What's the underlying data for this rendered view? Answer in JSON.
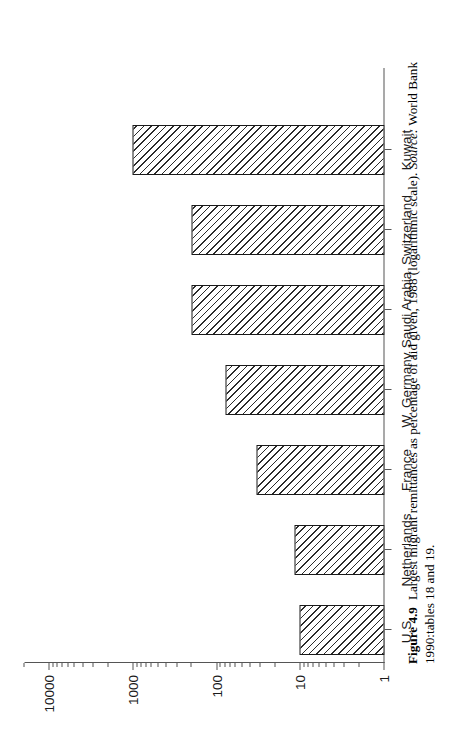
{
  "figure": {
    "number_label": "Figure 4.9",
    "caption_text": "Largest migrant remittances as percentage of aid given, 1988 (logarithmic scale).",
    "source_label": "Source:",
    "source_text": "World Bank 1990:tables 18 and 19."
  },
  "chart_data": {
    "type": "bar",
    "title": "Largest migrant remittances as percentage of aid given, 1988 (logarithmic scale)",
    "xlabel": "",
    "ylabel": "",
    "scale": "log",
    "orientation": "vertical-bars-on-rotated-page",
    "grid": false,
    "legend": null,
    "ylim": [
      1,
      20000
    ],
    "categories": [
      "U.S.",
      "Netherlands",
      "France",
      "W. Germany",
      "Saudi Arabia",
      "Switzerland",
      "Kuwait"
    ],
    "values": [
      10.4,
      11.9,
      34,
      80,
      200,
      205,
      1030
    ],
    "yticks": [
      {
        "value": 1,
        "label": "1"
      },
      {
        "value": 10,
        "label": "10"
      },
      {
        "value": 100,
        "label": "100"
      },
      {
        "value": 1000,
        "label": "1000"
      },
      {
        "value": 10000,
        "label": "10000"
      }
    ],
    "minor_ticks_per_decade": [
      2,
      3,
      4,
      5,
      6,
      7,
      8,
      9
    ]
  },
  "axis": {
    "tick_labels": [
      "1",
      "10",
      "100",
      "1000",
      "10000"
    ]
  },
  "bars": [
    {
      "label": "U.S.",
      "value": 10.4
    },
    {
      "label": "Netherlands",
      "value": 11.9
    },
    {
      "label": "France",
      "value": 34
    },
    {
      "label": "W. Germany",
      "value": 80
    },
    {
      "label": "Saudi Arabia",
      "value": 200
    },
    {
      "label": "Switzerland",
      "value": 205
    },
    {
      "label": "Kuwait",
      "value": 1030
    }
  ],
  "style": {
    "bar_outline": "#1a1a1a",
    "bar_hatch": "#2b2b2b",
    "axis_color": "#555555",
    "text_color": "#111111",
    "background": "#ffffff"
  }
}
